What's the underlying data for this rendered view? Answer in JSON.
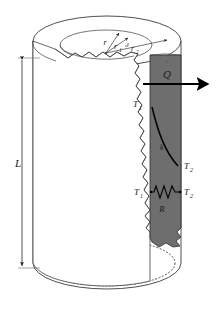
{
  "figure": {
    "type": "technical-diagram"
  },
  "labels": {
    "radius_outer_arrow": "r",
    "radius_inner": "r",
    "radius_inner_sub": "1",
    "radius_outer": "r",
    "radius_outer_sub": "2",
    "length": "L",
    "heat_rate": "Q",
    "heat_rate_dot": "˙",
    "temp_inner_top": "T",
    "temp_inner_top_sub": "1",
    "temp_outer_mid": "T",
    "temp_outer_mid_sub": "2",
    "conductivity": "k",
    "temp_inner_resistor": "T",
    "temp_inner_resistor_sub": "1",
    "temp_outer_resistor": "T",
    "temp_outer_resistor_sub": "2",
    "resistance": "R"
  },
  "colors": {
    "background": "#ffffff",
    "wall_band": "#6e6e6e",
    "outline": "#3b3b3b",
    "text": "#1a1a1a",
    "curve": "#000000"
  },
  "geometry": {
    "cylinder_length_px": 210,
    "band_left_px": 150,
    "band_right_px": 181
  }
}
